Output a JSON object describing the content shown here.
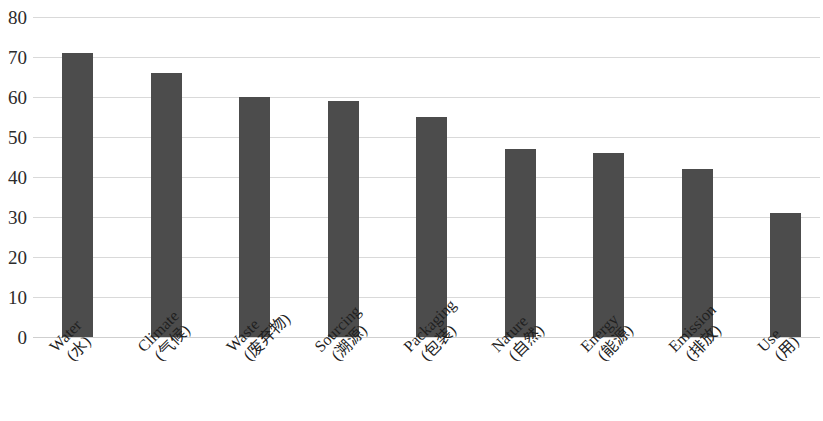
{
  "chart_data": {
    "type": "bar",
    "title": "",
    "subtitle": "",
    "xlabel": "",
    "ylabel": "",
    "ylim": [
      0,
      80
    ],
    "ytick_step": 10,
    "yticks": [
      "0",
      "10",
      "20",
      "30",
      "40",
      "50",
      "60",
      "70",
      "80"
    ],
    "grid": "horizontal",
    "legend": "none",
    "bar_color": "#4c4c4c",
    "gridline_color": "#d9d9d9",
    "axis_text_color": "#2b2b2b",
    "categories": [
      "Water\n(水)",
      "Climate\n(气候)",
      "Waste\n(废弃物)",
      "Sourcing\n(溯源)",
      "Packaging\n(包装)",
      "Nature\n(自然)",
      "Energy\n(能源)",
      "Emission\n(排放)",
      "Use\n(用)"
    ],
    "categories_en": [
      "Water",
      "Climate",
      "Waste",
      "Sourcing",
      "Packaging",
      "Nature",
      "Energy",
      "Emission",
      "Use"
    ],
    "categories_zh": [
      "(水)",
      "(气候)",
      "(废弃物)",
      "(溯源)",
      "(包装)",
      "(自然)",
      "(能源)",
      "(排放)",
      "(用)"
    ],
    "values": [
      71,
      66,
      60,
      59,
      55,
      47,
      46,
      42,
      31
    ]
  }
}
